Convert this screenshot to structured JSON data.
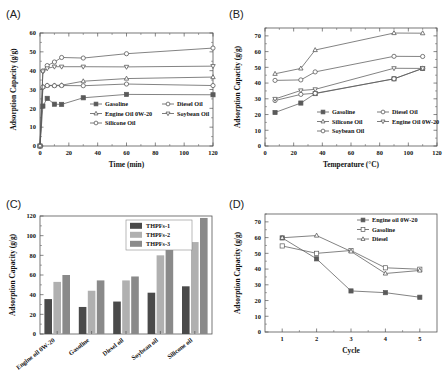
{
  "figure": {
    "panels": [
      {
        "tag": "(A)"
      },
      {
        "tag": "(B)"
      },
      {
        "tag": "(C)"
      },
      {
        "tag": "(D)"
      }
    ]
  },
  "chart_data": [
    {
      "panel": "(A)",
      "type": "line",
      "title": "",
      "xlabel": "Time (min)",
      "ylabel": "Adsorption Capacity (g/g)",
      "xlim": [
        0,
        120
      ],
      "ylim": [
        0,
        60
      ],
      "xticks": [
        0,
        20,
        40,
        60,
        80,
        100,
        120
      ],
      "yticks": [
        0,
        10,
        20,
        30,
        40,
        50,
        60
      ],
      "grid": false,
      "legend_position": "lower-center-inside",
      "x": [
        0,
        2,
        5,
        10,
        15,
        30,
        60,
        120
      ],
      "series": [
        {
          "name": "Gasoline",
          "marker": "square",
          "values": [
            0,
            21.2,
            25.3,
            22.2,
            22.1,
            25.6,
            27.4,
            27.2
          ]
        },
        {
          "name": "Engine Oil 0W-20",
          "marker": "triangle",
          "values": [
            0,
            31.4,
            32.2,
            32.2,
            32.3,
            34.4,
            35.8,
            36.6
          ]
        },
        {
          "name": "Silicone Oil",
          "marker": "circle",
          "values": [
            0,
            39.9,
            42.7,
            44.6,
            47.0,
            46.7,
            49.0,
            52.0
          ]
        },
        {
          "name": "Diesel Oil",
          "marker": "circle",
          "values": [
            0,
            31.3,
            32.1,
            32.0,
            32.1,
            32.0,
            32.9,
            32.1
          ]
        },
        {
          "name": "Soybean Oil",
          "marker": "dtriangle",
          "values": [
            0,
            39.6,
            41.2,
            42.1,
            42.1,
            42.1,
            42.0,
            42.4
          ]
        }
      ],
      "legend": [
        "Gasoline",
        "Diesel Oil",
        "Engine Oil 0W-20",
        "Soybean Oil",
        "Silicone Oil"
      ]
    },
    {
      "panel": "(B)",
      "type": "line",
      "title": "",
      "xlabel": "Temperature (°C)",
      "ylabel": "Adsorption Capacity (g/g)",
      "xlim": [
        0,
        120
      ],
      "ylim": [
        0,
        75
      ],
      "xticks": [
        0,
        20,
        40,
        60,
        80,
        100,
        120
      ],
      "yticks": [
        0,
        10,
        20,
        30,
        40,
        50,
        60,
        70
      ],
      "grid": false,
      "legend_position": "lower-center-inside",
      "x": [
        7,
        25,
        35,
        90,
        110
      ],
      "series": [
        {
          "name": "Gasoline",
          "marker": "square",
          "values": [
            21.3,
            27.3,
            33.3,
            42.7,
            49.3
          ]
        },
        {
          "name": "Silicone Oil",
          "marker": "triangle",
          "values": [
            45.9,
            49.3,
            61.0,
            71.8,
            71.7
          ]
        },
        {
          "name": "Soybean Oil",
          "marker": "circle",
          "values": [
            28.9,
            32.8,
            33.5,
            42.7,
            49.3
          ]
        },
        {
          "name": "Diesel Oil",
          "marker": "circle",
          "values": [
            41.7,
            42.0,
            47.1,
            57.0,
            56.9
          ]
        },
        {
          "name": "Engine Oil 0W-20",
          "marker": "dtriangle",
          "values": [
            29.9,
            35.3,
            36.0,
            49.4,
            49.3
          ]
        }
      ],
      "legend": [
        "Gasoline",
        "Diesel Oil",
        "Silicone Oil",
        "Engine Oil 0W-20",
        "Soybean Oil"
      ]
    },
    {
      "panel": "(C)",
      "type": "bar",
      "title": "",
      "xlabel": "",
      "ylabel": "Adsorption Capacity (g/g)",
      "ylim": [
        0,
        120
      ],
      "yticks": [
        0,
        20,
        40,
        60,
        80,
        100,
        120
      ],
      "grid": false,
      "legend_position": "top-right-inside",
      "categories": [
        "Engine oil 0W-20",
        "Gasoline",
        "Diesel oil",
        "Soybean oil",
        "Silicone oil"
      ],
      "series": [
        {
          "name": "THPFs-1",
          "color": "#4a4a4a",
          "values": [
            35.5,
            27.5,
            33.0,
            42.0,
            48.5
          ]
        },
        {
          "name": "THPFs-2",
          "color": "#b0b0b0",
          "values": [
            53.0,
            44.0,
            54.5,
            80.0,
            93.5
          ]
        },
        {
          "name": "THPFs-3",
          "color": "#8a8a8a",
          "values": [
            60.0,
            54.5,
            58.5,
            90.0,
            118.0
          ]
        }
      ],
      "legend": [
        "THPFs-1",
        "THPFs-2",
        "THPFs-3"
      ]
    },
    {
      "panel": "(D)",
      "type": "line",
      "title": "",
      "xlabel": "Cycle",
      "ylabel": "Adsorption Capacity (g/g)",
      "xlim": [
        0.5,
        5.5
      ],
      "ylim": [
        0,
        75
      ],
      "xticks": [
        1,
        2,
        3,
        4,
        5
      ],
      "yticks": [
        0,
        10,
        20,
        30,
        40,
        50,
        60,
        70
      ],
      "grid": false,
      "legend_position": "top-right-inside",
      "x": [
        1,
        2,
        3,
        4,
        5
      ],
      "series": [
        {
          "name": "Engine oil 0W-20",
          "marker": "square",
          "values": [
            59.8,
            46.5,
            26.1,
            25.0,
            22.1
          ]
        },
        {
          "name": "Gasoline",
          "marker": "square-open",
          "values": [
            54.7,
            50.0,
            51.8,
            40.8,
            39.9
          ]
        },
        {
          "name": "Diesel",
          "marker": "triangle",
          "values": [
            59.9,
            61.3,
            51.2,
            37.2,
            39.1
          ]
        }
      ],
      "legend": [
        "Engine oil 0W-20",
        "Gasoline",
        "Diesel"
      ]
    }
  ]
}
